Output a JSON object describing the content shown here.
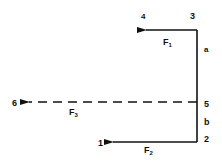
{
  "diagram": {
    "points": {
      "p1": "1",
      "p2": "2",
      "p3": "3",
      "p4": "4",
      "p5": "5",
      "p6": "6"
    },
    "segments": {
      "a": "a",
      "b": "b"
    },
    "forces": {
      "f1": {
        "symbol": "F",
        "subscript": "1",
        "style": "solid"
      },
      "f2": {
        "symbol": "F",
        "subscript": "2",
        "style": "solid"
      },
      "f3": {
        "symbol": "F",
        "subscript": "3",
        "style": "dashed"
      }
    },
    "colors": {
      "line": "#111111",
      "background": "#ffffff"
    }
  }
}
